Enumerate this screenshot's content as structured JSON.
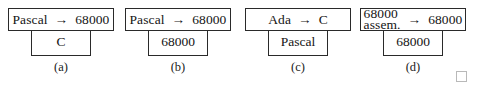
{
  "figure": {
    "background_color": "#ffffff",
    "line_color": "#2a2a2a",
    "text_color": "#141414",
    "arrow_glyph": "→",
    "diagrams": [
      {
        "caption": "(a)",
        "source": "Pascal",
        "source_line2": "",
        "arrow": "→",
        "target": "68000",
        "implementation": "C"
      },
      {
        "caption": "(b)",
        "source": "Pascal",
        "source_line2": "",
        "arrow": "→",
        "target": "68000",
        "implementation": "68000"
      },
      {
        "caption": "(c)",
        "source": "Ada",
        "source_line2": "",
        "arrow": "→",
        "target": "C",
        "implementation": "Pascal"
      },
      {
        "caption": "(d)",
        "source": "68000",
        "source_line2": "assem.",
        "arrow": "→",
        "target": "68000",
        "implementation": "68000"
      }
    ]
  },
  "artifacts": {
    "corner_square": {
      "border_color": "#b9b9b9"
    }
  }
}
